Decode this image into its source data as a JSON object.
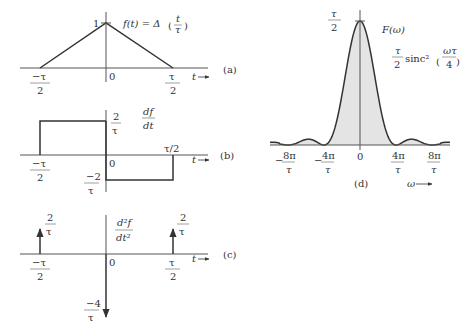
{
  "panels": {
    "a": {
      "label": "(a)",
      "title": "f(t) = Δ(t/τ)",
      "title_parts": {
        "lhs": "f(t) = Δ",
        "num": "t",
        "den": "τ"
      },
      "peak_label": "1",
      "origin": "0",
      "axis_label": "t",
      "ticks": [
        {
          "num": "−τ",
          "den": "2"
        },
        {
          "num": "τ",
          "den": "2"
        }
      ]
    },
    "b": {
      "label": "(b)",
      "title_num": "df",
      "title_den": "dt",
      "pos_level": {
        "num": "2",
        "den": "τ"
      },
      "neg_level": {
        "num": "−2",
        "den": "τ"
      },
      "origin": "0",
      "axis_label": "t",
      "tick_left": {
        "num": "−τ",
        "den": "2"
      },
      "tick_right": "τ/2"
    },
    "c": {
      "label": "(c)",
      "title_num": "d²f",
      "title_den": "dt²",
      "left_impulse": {
        "num": "2",
        "den": "τ"
      },
      "right_impulse": {
        "num": "2",
        "den": "τ"
      },
      "center_impulse": {
        "num": "−4",
        "den": "τ"
      },
      "origin": "0",
      "axis_label": "t",
      "ticks": [
        {
          "num": "−τ",
          "den": "2"
        },
        {
          "num": "τ",
          "den": "2"
        }
      ]
    },
    "d": {
      "label": "(d)",
      "title": "F(ω)",
      "peak_label": {
        "num": "τ",
        "den": "2"
      },
      "formula": {
        "coef_num": "τ",
        "coef_den": "2",
        "fn": "sinc²",
        "arg_num": "ωτ",
        "arg_den": "4"
      },
      "axis_label": "ω",
      "ticks": [
        {
          "sign": "−",
          "num": "8π",
          "den": "τ"
        },
        {
          "sign": "−",
          "num": "4π",
          "den": "τ"
        },
        {
          "sign": "",
          "num": "0",
          "den": ""
        },
        {
          "sign": "",
          "num": "4π",
          "den": "τ"
        },
        {
          "sign": "",
          "num": "8π",
          "den": "τ"
        }
      ]
    }
  },
  "colors": {
    "line": "#333333",
    "axis": "#555555",
    "fill": "#e4e4e4"
  }
}
